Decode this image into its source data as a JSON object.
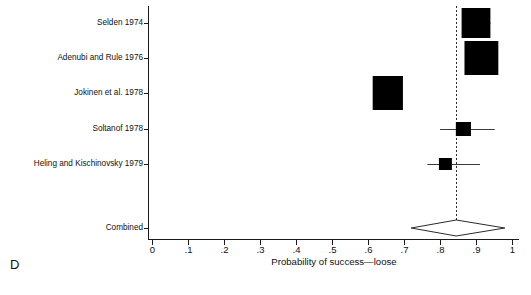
{
  "figure": {
    "panel_label": "D",
    "xlabel": "Probability of success—loose"
  },
  "chart_data": {
    "type": "scatter",
    "subtype": "forest-plot",
    "title": "",
    "xlabel": "Probability of success—loose",
    "ylabel": "",
    "xlim": [
      0,
      1
    ],
    "xticks": [
      0,
      0.1,
      0.2,
      0.3,
      0.4,
      0.5,
      0.6,
      0.7,
      0.8,
      0.9,
      1
    ],
    "xticklabels": [
      "0",
      ".1",
      ".2",
      ".3",
      ".4",
      ".5",
      ".6",
      ".7",
      ".8",
      ".9",
      "1"
    ],
    "grid": false,
    "legend": false,
    "reference_line": {
      "value": 0.845,
      "style": "dashed",
      "orientation": "vertical"
    },
    "categories": [
      "Selden 1974",
      "Adenubi and Rule 1976",
      "Jokinen et al. 1978",
      "Soltanof 1978",
      "Heling and Kischinovsky 1979",
      "Combined"
    ],
    "studies": [
      {
        "label": "Selden 1974",
        "estimate": 0.9,
        "ci_low": 0.9,
        "ci_high": 0.94,
        "box_half_width": 0.04,
        "box_half_height": 15,
        "marker": "box"
      },
      {
        "label": "Adenubi and Rule 1976",
        "estimate": 0.915,
        "ci_low": 0.915,
        "ci_high": 0.915,
        "box_half_width": 0.047,
        "box_half_height": 17,
        "marker": "box"
      },
      {
        "label": "Jokinen et al. 1978",
        "estimate": 0.655,
        "ci_low": 0.655,
        "ci_high": 0.655,
        "box_half_width": 0.042,
        "box_half_height": 17,
        "marker": "box"
      },
      {
        "label": "Soltanof 1978",
        "estimate": 0.865,
        "ci_low": 0.8,
        "ci_high": 0.952,
        "box_half_width": 0.021,
        "box_half_height": 7,
        "marker": "box"
      },
      {
        "label": "Heling and Kischinovsky 1979",
        "estimate": 0.815,
        "ci_low": 0.765,
        "ci_high": 0.911,
        "box_half_width": 0.018,
        "box_half_height": 6,
        "marker": "box"
      }
    ],
    "combined": {
      "label": "Combined",
      "estimate": 0.845,
      "ci_low": 0.72,
      "ci_high": 0.98,
      "marker": "diamond"
    }
  }
}
